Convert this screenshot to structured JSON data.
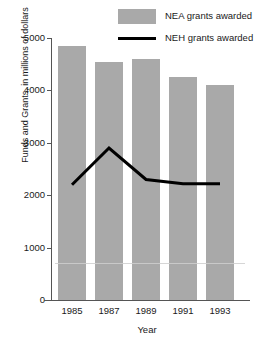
{
  "chart_data": {
    "type": "bar",
    "title": "",
    "subtitle": "",
    "xlabel": "Year",
    "ylabel": "Funds and Grants, in millions of dollars",
    "categories": [
      "1985",
      "1987",
      "1989",
      "1991",
      "1993"
    ],
    "ylim": [
      0,
      5000
    ],
    "ytick_labels": [
      "0",
      "1000",
      "2000",
      "3000",
      "4000",
      "5000"
    ],
    "ytick_values": [
      0,
      1000,
      2000,
      3000,
      4000,
      5000
    ],
    "grid": false,
    "legend_position": "top-right",
    "series": [
      {
        "name": "NEA grants awarded",
        "type": "bar",
        "color": "#a9a9a9",
        "values": [
          4850,
          4550,
          4600,
          4250,
          4100
        ]
      },
      {
        "name": "NEH grants awarded",
        "type": "line",
        "color": "#000000",
        "values": [
          2200,
          2900,
          2300,
          2220,
          2220
        ]
      }
    ]
  },
  "legend": {
    "items": [
      {
        "label": "NEA grants awarded",
        "marker": "box",
        "color": "#a9a9a9"
      },
      {
        "label": "NEH grants awarded",
        "marker": "line",
        "color": "#000000"
      }
    ]
  },
  "axes": {
    "y_title": "Funds and Grants, in millions of dollars",
    "x_title": "Year"
  }
}
